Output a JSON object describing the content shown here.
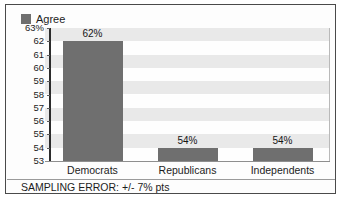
{
  "chart_data": {
    "type": "bar",
    "title": "",
    "subtitle": "",
    "xlabel": "",
    "ylabel": "",
    "categories": [
      "Democrats",
      "Republicans",
      "Independents"
    ],
    "values": [
      62,
      54,
      54
    ],
    "value_labels": [
      "62%",
      "54%",
      "54%"
    ],
    "ylim": [
      53,
      63
    ],
    "y_ticks": [
      53,
      54,
      55,
      56,
      57,
      58,
      59,
      60,
      61,
      62,
      63
    ],
    "y_tick_labels": [
      "53",
      "54",
      "55",
      "56",
      "57",
      "58",
      "59",
      "60",
      "61",
      "62",
      "63%"
    ],
    "grid": "alternating-horizontal-bands",
    "legend": {
      "position": "top-left",
      "entries": [
        {
          "label": "Agree",
          "swatch": "legend-swatch-icon",
          "color": "#6f6f6f"
        }
      ]
    },
    "series": [
      {
        "name": "Agree",
        "color": "#6f6f6f",
        "values": [
          62,
          54,
          54
        ]
      }
    ],
    "annotations": [
      {
        "name": "sampling-error-note",
        "text": "SAMPLING ERROR: +/- 7% pts"
      }
    ]
  },
  "footer": {
    "sampling_error": "SAMPLING ERROR: +/- 7% pts"
  },
  "colors": {
    "bar": "#6f6f6f",
    "band": "#e9e9e9",
    "band_alt": "#fefefe",
    "axis": "#2c2c2c",
    "frame": "#4a4a4a",
    "text": "#1c1c1c"
  }
}
